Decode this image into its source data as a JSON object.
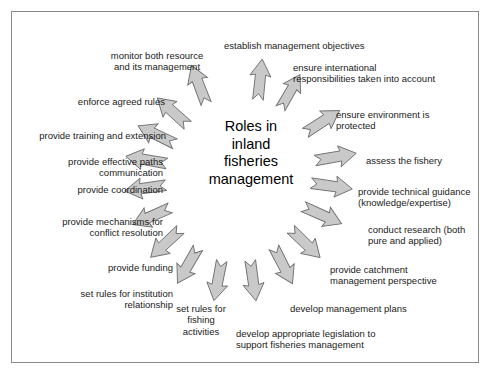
{
  "figure": {
    "kind": "radial-concept-diagram",
    "center_title": "Roles in\ninland\nfisheries\nmanagement",
    "border_color": "#8a8a8a",
    "background_color": "#ffffff",
    "arrow_fill": "#c9c9c9",
    "arrow_stroke": "#6e6e6e",
    "text_color": "#1a1a1a",
    "arrow_count": 18
  },
  "roles": [
    {
      "id": "establish-management-objectives",
      "label": "establish management objectives",
      "align": "left",
      "x": 224,
      "y": 40,
      "w": 170,
      "arrow": {
        "cx": 260,
        "cy": 80,
        "angle": -84,
        "len": 42,
        "head": 17,
        "tail": 8
      }
    },
    {
      "id": "ensure-international-responsibilities",
      "label": "ensure international\nresponsibilities taken into account",
      "align": "left",
      "x": 293,
      "y": 62,
      "w": 175,
      "arrow": {
        "cx": 290,
        "cy": 92,
        "angle": -60,
        "len": 40,
        "head": 16,
        "tail": 8
      }
    },
    {
      "id": "ensure-environment-protected",
      "label": "ensure environment is\nprotected",
      "align": "left",
      "x": 336,
      "y": 109,
      "w": 130,
      "arrow": {
        "cx": 322,
        "cy": 122,
        "angle": -33,
        "len": 42,
        "head": 17,
        "tail": 8
      }
    },
    {
      "id": "assess-the-fishery",
      "label": "assess the fishery",
      "align": "left",
      "x": 366,
      "y": 155,
      "w": 110,
      "arrow": {
        "cx": 335,
        "cy": 157,
        "angle": -10,
        "len": 43,
        "head": 17,
        "tail": 8
      }
    },
    {
      "id": "provide-technical-guidance",
      "label": "provide technical guidance\n(knowledge/expertise)",
      "align": "left",
      "x": 358,
      "y": 186,
      "w": 140,
      "arrow": {
        "cx": 331,
        "cy": 186,
        "angle": 8,
        "len": 43,
        "head": 17,
        "tail": 8
      }
    },
    {
      "id": "conduct-research",
      "label": "conduct research (both\npure and applied)",
      "align": "left",
      "x": 368,
      "y": 224,
      "w": 130,
      "arrow": {
        "cx": 322,
        "cy": 215,
        "angle": 24,
        "len": 43,
        "head": 17,
        "tail": 8
      }
    },
    {
      "id": "provide-catchment-management-perspective",
      "label": "provide catchment\nmanagement perspective",
      "align": "left",
      "x": 330,
      "y": 264,
      "w": 150,
      "arrow": {
        "cx": 305,
        "cy": 243,
        "angle": 44,
        "len": 42,
        "head": 17,
        "tail": 8
      }
    },
    {
      "id": "develop-management-plans",
      "label": "develop management plans",
      "align": "left",
      "x": 290,
      "y": 303,
      "w": 150,
      "arrow": {
        "cx": 283,
        "cy": 265,
        "angle": 63,
        "len": 42,
        "head": 17,
        "tail": 8
      }
    },
    {
      "id": "develop-appropriate-legislation",
      "label": "develop appropriate legislation to\nsupport fisheries management",
      "align": "left",
      "x": 236,
      "y": 328,
      "w": 185,
      "arrow": {
        "cx": 253,
        "cy": 280,
        "angle": 82,
        "len": 42,
        "head": 17,
        "tail": 8
      }
    },
    {
      "id": "set-rules-for-fishing-activities",
      "label": "set rules for\nfishing\nactivities",
      "align": "center",
      "x": 166,
      "y": 303,
      "w": 70,
      "arrow": {
        "cx": 218,
        "cy": 280,
        "angle": 101,
        "len": 42,
        "head": 17,
        "tail": 8
      }
    },
    {
      "id": "set-rules-for-institution-relationship",
      "label": "set rules for institution\nrelationship",
      "align": "right",
      "x": 48,
      "y": 288,
      "w": 125,
      "arrow": {
        "cx": 188,
        "cy": 265,
        "angle": 120,
        "len": 42,
        "head": 17,
        "tail": 8
      }
    },
    {
      "id": "provide-funding",
      "label": "provide funding",
      "align": "right",
      "x": 68,
      "y": 262,
      "w": 105,
      "arrow": {
        "cx": 166,
        "cy": 243,
        "angle": 137,
        "len": 42,
        "head": 17,
        "tail": 8
      }
    },
    {
      "id": "provide-mechanisms-for-conflict-resolution",
      "label": "provide mechanisms for\nconflict resolution",
      "align": "right",
      "x": 18,
      "y": 216,
      "w": 145,
      "arrow": {
        "cx": 152,
        "cy": 216,
        "angle": 156,
        "len": 42,
        "head": 17,
        "tail": 8
      }
    },
    {
      "id": "provide-coordination",
      "label": "provide coordination",
      "align": "right",
      "x": 30,
      "y": 184,
      "w": 133,
      "arrow": {
        "cx": 146,
        "cy": 188,
        "angle": 172,
        "len": 43,
        "head": 17,
        "tail": 8
      }
    },
    {
      "id": "provide-effective-paths-communication",
      "label": "provide effective paths\ncommunication",
      "align": "right",
      "x": 18,
      "y": 156,
      "w": 145,
      "arrow": {
        "cx": 147,
        "cy": 160,
        "angle": 190,
        "len": 43,
        "head": 17,
        "tail": 8
      }
    },
    {
      "id": "provide-training-and-extension",
      "label": "provide training and extension",
      "align": "right",
      "x": 16,
      "y": 130,
      "w": 150,
      "arrow": {
        "cx": 157,
        "cy": 135,
        "angle": 206,
        "len": 42,
        "head": 17,
        "tail": 8
      }
    },
    {
      "id": "enforce-agreed-rules",
      "label": "enforce agreed rules",
      "align": "right",
      "x": 40,
      "y": 96,
      "w": 125,
      "arrow": {
        "cx": 173,
        "cy": 112,
        "angle": 222,
        "len": 42,
        "head": 17,
        "tail": 8
      }
    },
    {
      "id": "monitor-both-resource-and-its-management",
      "label": "monitor both resource\nand its management",
      "align": "center",
      "x": 92,
      "y": 50,
      "w": 130,
      "arrow": {
        "cx": 199,
        "cy": 85,
        "angle": 249,
        "len": 42,
        "head": 17,
        "tail": 8
      }
    }
  ]
}
